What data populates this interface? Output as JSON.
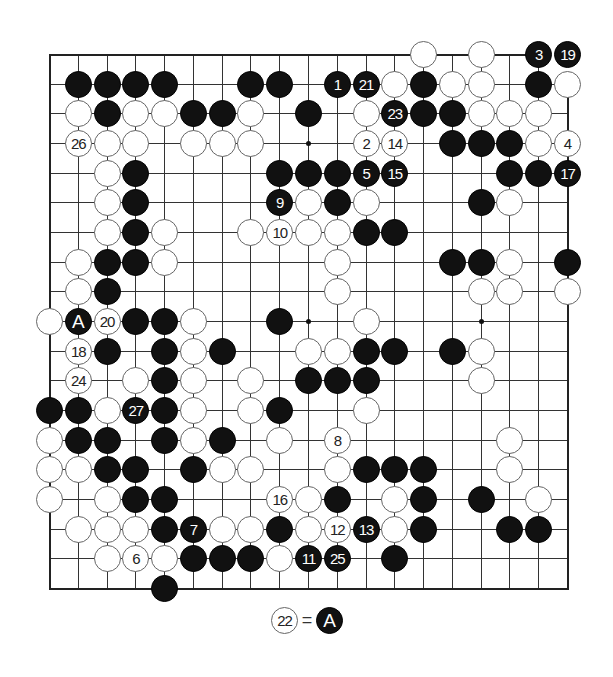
{
  "diagram": {
    "type": "go-board",
    "size": 19,
    "visible_edges": {
      "top": "cols 0-17 at row 0",
      "left": "rows 0-18",
      "bottom": "cols 0-18 at row 18",
      "right": "rows 1-18"
    },
    "star_points_visible": [
      [
        3,
        9
      ],
      [
        9,
        9
      ],
      [
        9,
        15
      ]
    ],
    "stones": [
      {
        "r": 0,
        "c": 13,
        "color": "white"
      },
      {
        "r": 0,
        "c": 15,
        "color": "white"
      },
      {
        "r": 0,
        "c": 17,
        "color": "black",
        "label": "3"
      },
      {
        "r": 0,
        "c": 18,
        "color": "black",
        "label": "19"
      },
      {
        "r": 1,
        "c": 1,
        "color": "black"
      },
      {
        "r": 1,
        "c": 2,
        "color": "black"
      },
      {
        "r": 1,
        "c": 3,
        "color": "black"
      },
      {
        "r": 1,
        "c": 4,
        "color": "black"
      },
      {
        "r": 1,
        "c": 7,
        "color": "black"
      },
      {
        "r": 1,
        "c": 8,
        "color": "black"
      },
      {
        "r": 1,
        "c": 10,
        "color": "black",
        "label": "1"
      },
      {
        "r": 1,
        "c": 11,
        "color": "black",
        "label": "21"
      },
      {
        "r": 1,
        "c": 12,
        "color": "white"
      },
      {
        "r": 1,
        "c": 13,
        "color": "black"
      },
      {
        "r": 1,
        "c": 14,
        "color": "white"
      },
      {
        "r": 1,
        "c": 15,
        "color": "white"
      },
      {
        "r": 1,
        "c": 17,
        "color": "black"
      },
      {
        "r": 1,
        "c": 18,
        "color": "white"
      },
      {
        "r": 2,
        "c": 1,
        "color": "white"
      },
      {
        "r": 2,
        "c": 2,
        "color": "black"
      },
      {
        "r": 2,
        "c": 3,
        "color": "white"
      },
      {
        "r": 2,
        "c": 4,
        "color": "white"
      },
      {
        "r": 2,
        "c": 5,
        "color": "black"
      },
      {
        "r": 2,
        "c": 6,
        "color": "black"
      },
      {
        "r": 2,
        "c": 7,
        "color": "white"
      },
      {
        "r": 2,
        "c": 9,
        "color": "black"
      },
      {
        "r": 2,
        "c": 11,
        "color": "white"
      },
      {
        "r": 2,
        "c": 12,
        "color": "black",
        "label": "23"
      },
      {
        "r": 2,
        "c": 13,
        "color": "black"
      },
      {
        "r": 2,
        "c": 14,
        "color": "black"
      },
      {
        "r": 2,
        "c": 15,
        "color": "white"
      },
      {
        "r": 2,
        "c": 16,
        "color": "white"
      },
      {
        "r": 2,
        "c": 17,
        "color": "white"
      },
      {
        "r": 3,
        "c": 1,
        "color": "white",
        "label": "26"
      },
      {
        "r": 3,
        "c": 2,
        "color": "white"
      },
      {
        "r": 3,
        "c": 3,
        "color": "white"
      },
      {
        "r": 3,
        "c": 5,
        "color": "white"
      },
      {
        "r": 3,
        "c": 6,
        "color": "white"
      },
      {
        "r": 3,
        "c": 7,
        "color": "white"
      },
      {
        "r": 3,
        "c": 11,
        "color": "white",
        "label": "2"
      },
      {
        "r": 3,
        "c": 12,
        "color": "white",
        "label": "14"
      },
      {
        "r": 3,
        "c": 14,
        "color": "black"
      },
      {
        "r": 3,
        "c": 15,
        "color": "black"
      },
      {
        "r": 3,
        "c": 16,
        "color": "black"
      },
      {
        "r": 3,
        "c": 17,
        "color": "white"
      },
      {
        "r": 3,
        "c": 18,
        "color": "white",
        "label": "4"
      },
      {
        "r": 4,
        "c": 2,
        "color": "white"
      },
      {
        "r": 4,
        "c": 3,
        "color": "black"
      },
      {
        "r": 4,
        "c": 8,
        "color": "black"
      },
      {
        "r": 4,
        "c": 9,
        "color": "black"
      },
      {
        "r": 4,
        "c": 10,
        "color": "black"
      },
      {
        "r": 4,
        "c": 11,
        "color": "black",
        "label": "5"
      },
      {
        "r": 4,
        "c": 12,
        "color": "black",
        "label": "15"
      },
      {
        "r": 4,
        "c": 16,
        "color": "black"
      },
      {
        "r": 4,
        "c": 17,
        "color": "black"
      },
      {
        "r": 4,
        "c": 18,
        "color": "black",
        "label": "17"
      },
      {
        "r": 5,
        "c": 2,
        "color": "white"
      },
      {
        "r": 5,
        "c": 3,
        "color": "black"
      },
      {
        "r": 5,
        "c": 8,
        "color": "black",
        "label": "9"
      },
      {
        "r": 5,
        "c": 9,
        "color": "white"
      },
      {
        "r": 5,
        "c": 10,
        "color": "black"
      },
      {
        "r": 5,
        "c": 11,
        "color": "white"
      },
      {
        "r": 5,
        "c": 15,
        "color": "black"
      },
      {
        "r": 5,
        "c": 16,
        "color": "white"
      },
      {
        "r": 6,
        "c": 2,
        "color": "white"
      },
      {
        "r": 6,
        "c": 3,
        "color": "black"
      },
      {
        "r": 6,
        "c": 4,
        "color": "white"
      },
      {
        "r": 6,
        "c": 7,
        "color": "white"
      },
      {
        "r": 6,
        "c": 8,
        "color": "white",
        "label": "10"
      },
      {
        "r": 6,
        "c": 9,
        "color": "white"
      },
      {
        "r": 6,
        "c": 10,
        "color": "white"
      },
      {
        "r": 6,
        "c": 11,
        "color": "black"
      },
      {
        "r": 6,
        "c": 12,
        "color": "black"
      },
      {
        "r": 7,
        "c": 1,
        "color": "white"
      },
      {
        "r": 7,
        "c": 2,
        "color": "black"
      },
      {
        "r": 7,
        "c": 3,
        "color": "black"
      },
      {
        "r": 7,
        "c": 4,
        "color": "white"
      },
      {
        "r": 7,
        "c": 10,
        "color": "white"
      },
      {
        "r": 7,
        "c": 14,
        "color": "black"
      },
      {
        "r": 7,
        "c": 15,
        "color": "black"
      },
      {
        "r": 7,
        "c": 16,
        "color": "white"
      },
      {
        "r": 7,
        "c": 18,
        "color": "black"
      },
      {
        "r": 8,
        "c": 1,
        "color": "white"
      },
      {
        "r": 8,
        "c": 2,
        "color": "black"
      },
      {
        "r": 8,
        "c": 10,
        "color": "white"
      },
      {
        "r": 8,
        "c": 15,
        "color": "white"
      },
      {
        "r": 8,
        "c": 16,
        "color": "white"
      },
      {
        "r": 8,
        "c": 18,
        "color": "white"
      },
      {
        "r": 9,
        "c": 0,
        "color": "white"
      },
      {
        "r": 9,
        "c": 1,
        "color": "black",
        "label": "A"
      },
      {
        "r": 9,
        "c": 2,
        "color": "white",
        "label": "20"
      },
      {
        "r": 9,
        "c": 3,
        "color": "black"
      },
      {
        "r": 9,
        "c": 4,
        "color": "black"
      },
      {
        "r": 9,
        "c": 5,
        "color": "white"
      },
      {
        "r": 9,
        "c": 8,
        "color": "black"
      },
      {
        "r": 9,
        "c": 11,
        "color": "white"
      },
      {
        "r": 10,
        "c": 1,
        "color": "white",
        "label": "18"
      },
      {
        "r": 10,
        "c": 2,
        "color": "black"
      },
      {
        "r": 10,
        "c": 4,
        "color": "black"
      },
      {
        "r": 10,
        "c": 5,
        "color": "white"
      },
      {
        "r": 10,
        "c": 6,
        "color": "black"
      },
      {
        "r": 10,
        "c": 9,
        "color": "white"
      },
      {
        "r": 10,
        "c": 10,
        "color": "white"
      },
      {
        "r": 10,
        "c": 11,
        "color": "black"
      },
      {
        "r": 10,
        "c": 12,
        "color": "black"
      },
      {
        "r": 10,
        "c": 14,
        "color": "black"
      },
      {
        "r": 10,
        "c": 15,
        "color": "white"
      },
      {
        "r": 11,
        "c": 1,
        "color": "white",
        "label": "24"
      },
      {
        "r": 11,
        "c": 3,
        "color": "white"
      },
      {
        "r": 11,
        "c": 4,
        "color": "black"
      },
      {
        "r": 11,
        "c": 5,
        "color": "white"
      },
      {
        "r": 11,
        "c": 7,
        "color": "white"
      },
      {
        "r": 11,
        "c": 9,
        "color": "black"
      },
      {
        "r": 11,
        "c": 10,
        "color": "black"
      },
      {
        "r": 11,
        "c": 11,
        "color": "black"
      },
      {
        "r": 11,
        "c": 15,
        "color": "white"
      },
      {
        "r": 12,
        "c": 0,
        "color": "black"
      },
      {
        "r": 12,
        "c": 1,
        "color": "black"
      },
      {
        "r": 12,
        "c": 2,
        "color": "white"
      },
      {
        "r": 12,
        "c": 3,
        "color": "black",
        "label": "27"
      },
      {
        "r": 12,
        "c": 4,
        "color": "black"
      },
      {
        "r": 12,
        "c": 5,
        "color": "white"
      },
      {
        "r": 12,
        "c": 7,
        "color": "white"
      },
      {
        "r": 12,
        "c": 8,
        "color": "black"
      },
      {
        "r": 12,
        "c": 11,
        "color": "white"
      },
      {
        "r": 13,
        "c": 0,
        "color": "white"
      },
      {
        "r": 13,
        "c": 1,
        "color": "black"
      },
      {
        "r": 13,
        "c": 2,
        "color": "black"
      },
      {
        "r": 13,
        "c": 4,
        "color": "black"
      },
      {
        "r": 13,
        "c": 5,
        "color": "white"
      },
      {
        "r": 13,
        "c": 6,
        "color": "black"
      },
      {
        "r": 13,
        "c": 8,
        "color": "white"
      },
      {
        "r": 13,
        "c": 10,
        "color": "white",
        "label": "8"
      },
      {
        "r": 13,
        "c": 16,
        "color": "white"
      },
      {
        "r": 14,
        "c": 0,
        "color": "white"
      },
      {
        "r": 14,
        "c": 1,
        "color": "white"
      },
      {
        "r": 14,
        "c": 2,
        "color": "black"
      },
      {
        "r": 14,
        "c": 3,
        "color": "black"
      },
      {
        "r": 14,
        "c": 5,
        "color": "black"
      },
      {
        "r": 14,
        "c": 6,
        "color": "white"
      },
      {
        "r": 14,
        "c": 7,
        "color": "white"
      },
      {
        "r": 14,
        "c": 10,
        "color": "white"
      },
      {
        "r": 14,
        "c": 11,
        "color": "black"
      },
      {
        "r": 14,
        "c": 12,
        "color": "black"
      },
      {
        "r": 14,
        "c": 13,
        "color": "black"
      },
      {
        "r": 14,
        "c": 16,
        "color": "white"
      },
      {
        "r": 15,
        "c": 0,
        "color": "white"
      },
      {
        "r": 15,
        "c": 2,
        "color": "white"
      },
      {
        "r": 15,
        "c": 3,
        "color": "black"
      },
      {
        "r": 15,
        "c": 4,
        "color": "black"
      },
      {
        "r": 15,
        "c": 8,
        "color": "white",
        "label": "16"
      },
      {
        "r": 15,
        "c": 9,
        "color": "white"
      },
      {
        "r": 15,
        "c": 10,
        "color": "black"
      },
      {
        "r": 15,
        "c": 12,
        "color": "white"
      },
      {
        "r": 15,
        "c": 13,
        "color": "black"
      },
      {
        "r": 15,
        "c": 15,
        "color": "black"
      },
      {
        "r": 15,
        "c": 17,
        "color": "white"
      },
      {
        "r": 16,
        "c": 1,
        "color": "white"
      },
      {
        "r": 16,
        "c": 2,
        "color": "white"
      },
      {
        "r": 16,
        "c": 3,
        "color": "white"
      },
      {
        "r": 16,
        "c": 4,
        "color": "black"
      },
      {
        "r": 16,
        "c": 5,
        "color": "black",
        "label": "7"
      },
      {
        "r": 16,
        "c": 6,
        "color": "white"
      },
      {
        "r": 16,
        "c": 7,
        "color": "white"
      },
      {
        "r": 16,
        "c": 8,
        "color": "black"
      },
      {
        "r": 16,
        "c": 9,
        "color": "white"
      },
      {
        "r": 16,
        "c": 10,
        "color": "white",
        "label": "12"
      },
      {
        "r": 16,
        "c": 11,
        "color": "black",
        "label": "13"
      },
      {
        "r": 16,
        "c": 12,
        "color": "white"
      },
      {
        "r": 16,
        "c": 13,
        "color": "black"
      },
      {
        "r": 16,
        "c": 16,
        "color": "black"
      },
      {
        "r": 16,
        "c": 17,
        "color": "black"
      },
      {
        "r": 17,
        "c": 2,
        "color": "white"
      },
      {
        "r": 17,
        "c": 3,
        "color": "white",
        "label": "6"
      },
      {
        "r": 17,
        "c": 4,
        "color": "white"
      },
      {
        "r": 17,
        "c": 5,
        "color": "black"
      },
      {
        "r": 17,
        "c": 6,
        "color": "black"
      },
      {
        "r": 17,
        "c": 7,
        "color": "black"
      },
      {
        "r": 17,
        "c": 8,
        "color": "white"
      },
      {
        "r": 17,
        "c": 9,
        "color": "black",
        "label": "11"
      },
      {
        "r": 17,
        "c": 10,
        "color": "black",
        "label": "25"
      },
      {
        "r": 17,
        "c": 12,
        "color": "black"
      },
      {
        "r": 18,
        "c": 4,
        "color": "black"
      }
    ]
  },
  "caption": {
    "left_stone": {
      "color": "white",
      "label": "22"
    },
    "equals": "=",
    "right_stone": {
      "color": "black",
      "label": "A"
    }
  }
}
